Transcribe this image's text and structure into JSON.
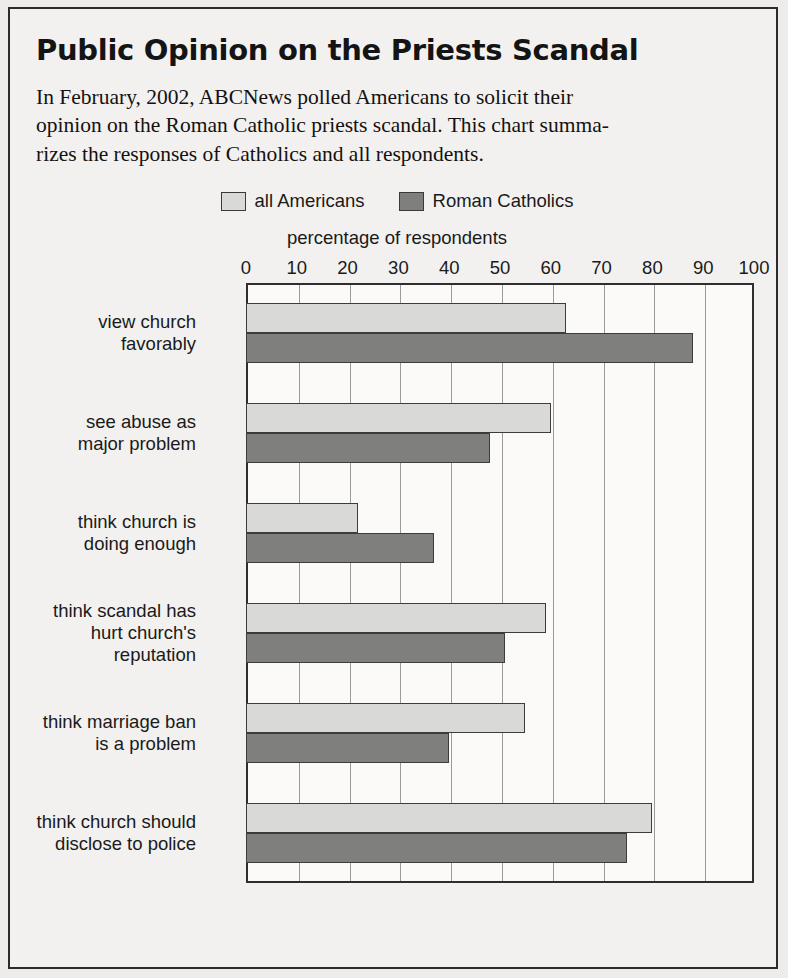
{
  "title": "Public Opinion on the Priests Scandal",
  "blurb": [
    "In February, 2002, ABCNews polled Americans to solicit their",
    "opinion on the Roman Catholic priests scandal. This chart summa-",
    "rizes the responses of Catholics and all respondents."
  ],
  "legend": [
    {
      "label": "all Americans",
      "color": "#d9d9d7"
    },
    {
      "label": "Roman Catholics",
      "color": "#7f7f7d"
    }
  ],
  "chart_data": {
    "type": "bar",
    "orientation": "horizontal",
    "title": "Public Opinion on the Priests Scandal",
    "xlabel": "percentage of respondents",
    "ylabel": "",
    "xlim": [
      0,
      100
    ],
    "xticks": [
      0,
      10,
      20,
      30,
      40,
      50,
      60,
      70,
      80,
      90,
      100
    ],
    "grid": true,
    "legend_position": "top-center",
    "categories": [
      "view church favorably",
      "see abuse as major problem",
      "think church is doing enough",
      "think scandal has hurt church's reputation",
      "think marriage ban is a problem",
      "think church should disclose to police"
    ],
    "category_lines": [
      [
        "view church",
        "favorably"
      ],
      [
        "see abuse as",
        "major problem"
      ],
      [
        "think church is",
        "doing enough"
      ],
      [
        "think scandal has",
        "hurt church's",
        "reputation"
      ],
      [
        "think marriage ban",
        "is a problem"
      ],
      [
        "think church should",
        "disclose to police"
      ]
    ],
    "series": [
      {
        "name": "all Americans",
        "color": "#d9d9d7",
        "values": [
          63,
          60,
          22,
          59,
          55,
          80
        ]
      },
      {
        "name": "Roman Catholics",
        "color": "#7f7f7d",
        "values": [
          88,
          48,
          37,
          51,
          40,
          75
        ]
      }
    ]
  }
}
